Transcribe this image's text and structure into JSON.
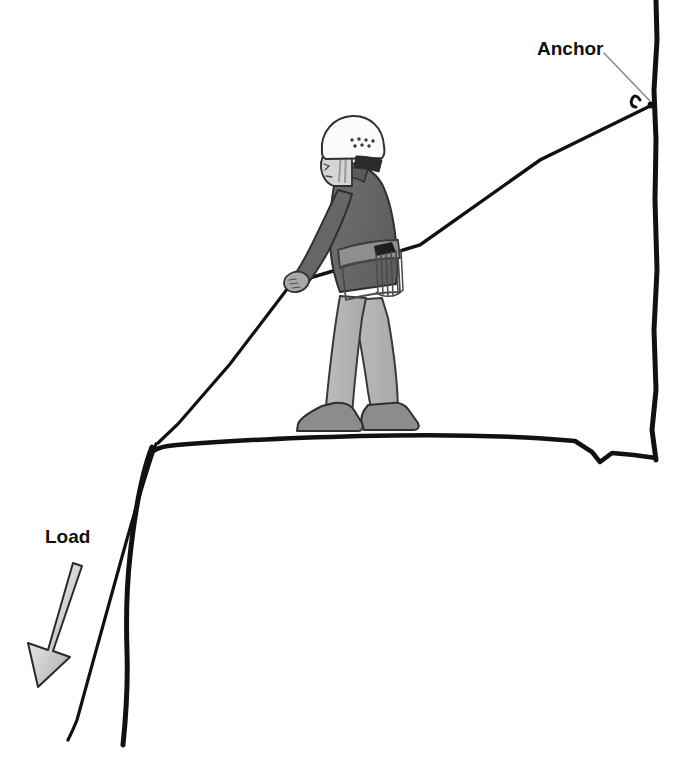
{
  "diagram": {
    "background_color": "#ffffff",
    "line_color": "#111111",
    "labels": [
      {
        "id": "anchor",
        "text": "Anchor",
        "x": 537,
        "y": 55,
        "leader": "from label to anchor point on cliff wall",
        "leader_color": "#8c8c8c"
      },
      {
        "id": "load",
        "text": "Load",
        "x": 45,
        "y": 543,
        "arrow_direction": "down-left",
        "arrow_fill_light": "#e8e8e8",
        "arrow_fill_dark": "#9a9a9a"
      }
    ],
    "anchor_point": {
      "x": 655,
      "y": 103,
      "hardware": "carabiner-hook"
    },
    "rope": {
      "color": "#111111",
      "path_description": "from climber's hand up-right to anchor, and from hand down-left over the cliff edge, continuing down the cliff face",
      "edge_bend_point": {
        "x": 152,
        "y": 443
      }
    },
    "cliff": {
      "top_edge_description": "gently curved ledge running left to right with a V notch near the right wall",
      "right_wall_x": 655,
      "notch_x": 592
    },
    "climber": {
      "pose": "standing in profile facing left, holding rope with left hand",
      "colors": {
        "helmet": "#fbfbfb",
        "face": "#d5d5d5",
        "jacket": "#6a6a6a",
        "harness": "#8f8f8f",
        "pants": "#b5b5b5",
        "boots": "#8c8c8c",
        "outline": "#2a2a2a"
      },
      "gear": [
        "helmet",
        "harness",
        "gear-loop-with-slings",
        "boots"
      ]
    }
  }
}
